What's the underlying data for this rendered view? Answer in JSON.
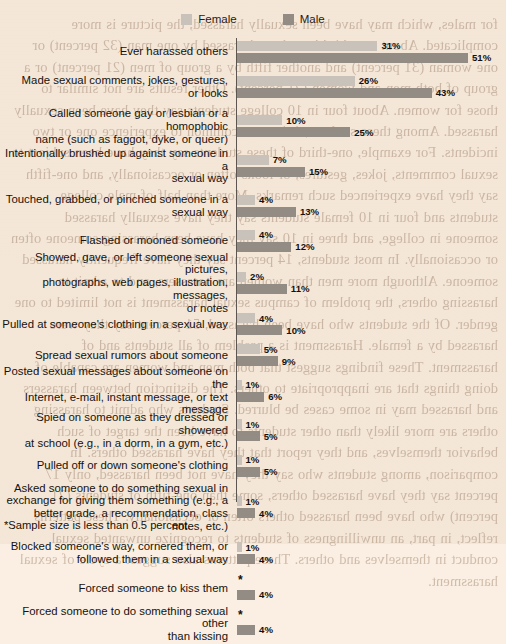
{
  "legend": {
    "items": [
      {
        "label": "Female",
        "color": "#c9c2ba",
        "icon": "legend-swatch-icon"
      },
      {
        "label": "Male",
        "color": "#938c85",
        "icon": "legend-swatch-icon"
      }
    ]
  },
  "footnote": "*Sample size is less than 0.5 percent.",
  "ghost_text": "for males, which may have been sexually harassed, the picture is more complicated. About one-third have been harassed by one man (32 percent) or one woman (31 percent) and another fifth by a group of men (21 percent) or a group of both men and women (21 percent). Other results are not similar to those for women. About four in 10 college students say they have been sexually harassed. Among these students, it is most common to experience one or two incidents. For example, one-third of these students say they have been subject to sexual comments, jokes, gestures, or looks often or occasionally, and one-fifth say they have experienced such remarks. More than half of male college students and four in 10 female students say they have sexually harassed someone in college, and three in 10 say they have been harassing someone often or occasionally. In most students, 14 percent say they have frequently harassed someone. Although more men than women are harassers, and to admit to harassing others, the problem of campus sexual harassment is not limited to one gender. Of the students who have been harassed, 51 percent say they were harassed by a female. Harassment is a problem of all students and of harassment. These findings suggest that both men and women are capable of doing things that are inappropriate to others. The distinction between harassers and harassed may in some cases be blurred. Students who admit to harassing others are more likely than other students to have been the target of such behavior themselves, and they report that they have harassed others. In comparison, among students who say they have not been harassed, only 17 percent say they have harassed others, some than one-fifth of students (21 percent) who have been harassed others often or occasionally. These patterns reflect, in part, an unwillingness of students to recognize unwanted sexual conduct in themselves and others. These patterns also suggest a cycle of sexual harassment.",
  "chart_data": {
    "type": "bar",
    "orientation": "horizontal",
    "title": "",
    "xlabel": "",
    "ylabel": "",
    "xlim": [
      0,
      55
    ],
    "grid": false,
    "legend_position": "top-center",
    "value_suffix": "%",
    "categories": [
      "Ever harassed others",
      "Made sexual comments, jokes, gestures, or looks",
      "Called someone gay or lesbian or a homophobic name (such as faggot, dyke, or queer)",
      "Intentionally brushed up against someone in a sexual way",
      "Touched, grabbed, or pinched someone in a sexual way",
      "Flashed or mooned someone",
      "Showed, gave, or left someone sexual pictures, photographs, web pages, illustration, messages, or notes",
      "Pulled at someone's clothing in a sexual way",
      "Spread sexual rumors about someone",
      "Posted sexual messages about someone on the Internet, e-mail, instant message, or text message",
      "Spied on someone as they dressed or showered at school (e.g., in a dorm, in a gym, etc.)",
      "Pulled off or down someone's clothing",
      "Asked someone to do something sexual in exchange for giving them something (e.g., a better grade, a recommendation, class notes, etc.)",
      "Blocked someone's way, cornered them, or followed them in a sexual way",
      "Forced someone to kiss them",
      "Forced someone to do something sexual other than kissing"
    ],
    "category_lines": [
      [
        "Ever harassed others"
      ],
      [
        "Made sexual comments, jokes, gestures,",
        "or looks"
      ],
      [
        "Called someone gay or lesbian or a homophobic",
        "name (such as faggot, dyke, or queer)"
      ],
      [
        "Intentionally brushed up against someone in a",
        "sexual way"
      ],
      [
        "Touched, grabbed, or pinched someone in a",
        "sexual way"
      ],
      [
        "Flashed or mooned someone"
      ],
      [
        "Showed, gave, or left someone sexual pictures,",
        "photographs, web pages, illustration, messages,",
        "or notes"
      ],
      [
        "Pulled at someone's clothing in a sexual way"
      ],
      [
        "Spread sexual rumors about someone"
      ],
      [
        "Posted sexual messages about someone on the",
        "Internet, e-mail, instant message, or text message"
      ],
      [
        "Spied on someone as they dressed or showered",
        "at school (e.g., in a dorm, in a gym, etc.)"
      ],
      [
        "Pulled off or down someone's clothing"
      ],
      [
        "Asked someone to do something sexual in",
        "exchange for giving them something (e.g., a",
        "better grade, a recommendation, class notes, etc.)"
      ],
      [
        "Blocked someone's way, cornered them, or",
        "followed them in a sexual way"
      ],
      [
        "Forced someone to kiss them"
      ],
      [
        "Forced someone to do something sexual other",
        "than kissing"
      ]
    ],
    "series": [
      {
        "name": "Female",
        "color": "#c9c2ba",
        "values": [
          31,
          26,
          10,
          7,
          4,
          4,
          2,
          4,
          5,
          1,
          1,
          1,
          1,
          1,
          0,
          0
        ],
        "labels": [
          "31%",
          "26%",
          "10%",
          "7%",
          "4%",
          "4%",
          "2%",
          "4%",
          "5%",
          "1%",
          "1%",
          "1%",
          "1%",
          "1%",
          "*",
          "*"
        ]
      },
      {
        "name": "Male",
        "color": "#938c85",
        "values": [
          51,
          43,
          25,
          15,
          13,
          12,
          11,
          10,
          9,
          6,
          5,
          5,
          4,
          4,
          4,
          4
        ],
        "labels": [
          "51%",
          "43%",
          "25%",
          "15%",
          "13%",
          "12%",
          "11%",
          "10%",
          "9%",
          "6%",
          "5%",
          "5%",
          "4%",
          "4%",
          "4%",
          "4%"
        ]
      }
    ]
  }
}
